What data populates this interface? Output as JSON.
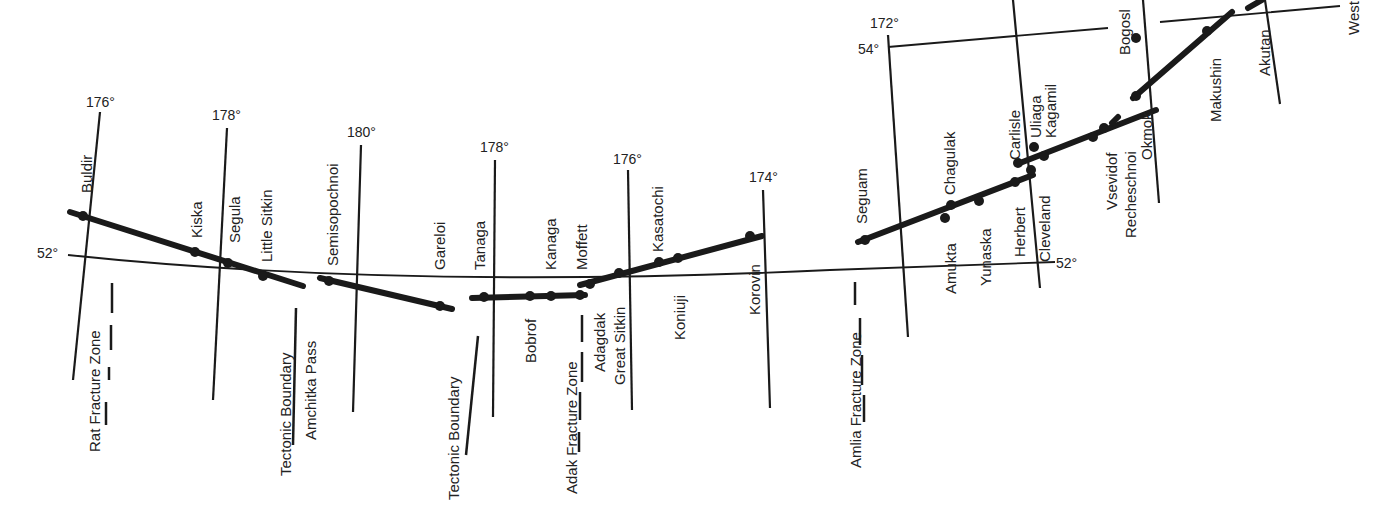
{
  "map": {
    "title": "Aleutian Arc volcanoes and fracture zones",
    "longitude_labels": [
      "176°",
      "178°",
      "180°",
      "178°",
      "176°",
      "174°",
      "172°"
    ],
    "latitude_labels": [
      "52°",
      "54°",
      "52°"
    ],
    "islands": [
      "Buldir",
      "Kiska",
      "Segula",
      "Little Sitkin",
      "Semisopochnoi",
      "Gareloi",
      "Tanaga",
      "Kanaga",
      "Moffett",
      "Bobrof",
      "Adagdak",
      "Great Sitkin",
      "Kasatochi",
      "Koniuji",
      "Korovin",
      "Seguam",
      "Amukta",
      "Chagulak",
      "Yunaska",
      "Herbert",
      "Carlisle",
      "Cleveland",
      "Uliaga",
      "Kagamil",
      "Vsevidof",
      "Recheschnoi",
      "Okmok",
      "Bogosl",
      "Makushin",
      "Akutan",
      "West"
    ],
    "features": {
      "rat_fz": "Rat Fracture Zone",
      "tectonic_1": "Tectonic Boundary",
      "amchitka": "Amchitka Pass",
      "tectonic_2": "Tectonic Boundary",
      "adak_fz": "Adak Fracture Zone",
      "amlia_fz": "Amlia Fracture Zone"
    }
  }
}
